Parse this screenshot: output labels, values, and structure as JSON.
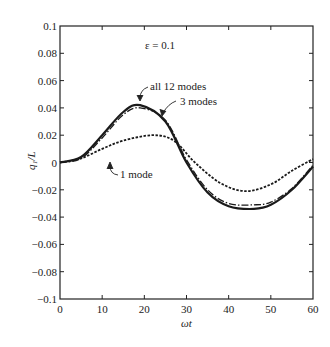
{
  "chart_data": {
    "type": "line",
    "title": "",
    "annotation": "ε = 0.1",
    "xlabel": "ωt",
    "ylabel": "q1/L",
    "xlim": [
      0,
      60
    ],
    "ylim": [
      -0.1,
      0.1
    ],
    "xticks": [
      0,
      10,
      20,
      30,
      40,
      50,
      60
    ],
    "xtick_labels": [
      "0",
      "10",
      "20",
      "30",
      "40",
      "50",
      "60"
    ],
    "yticks": [
      -0.1,
      -0.08,
      -0.06,
      -0.04,
      -0.02,
      0,
      0.02,
      0.04,
      0.06,
      0.08,
      0.1
    ],
    "ytick_labels": [
      "−0.1",
      "−0.08",
      "−0.06",
      "−0.04",
      "−0.02",
      "0",
      "0.02",
      "0.04",
      "0.06",
      "0.08",
      "0.1"
    ],
    "grid": false,
    "legend": "inline annotations with arrows",
    "x": [
      0,
      5,
      10,
      15,
      19,
      25,
      30,
      35,
      40,
      46,
      50,
      55,
      60
    ],
    "series": [
      {
        "name": "all 12 modes",
        "style": "solid",
        "values": [
          0,
          0.004,
          0.02,
          0.037,
          0.042,
          0.03,
          0.0,
          -0.022,
          -0.032,
          -0.034,
          -0.031,
          -0.02,
          -0.003
        ]
      },
      {
        "name": "3 modes",
        "style": "dash-dot",
        "values": [
          0,
          0.003,
          0.018,
          0.035,
          0.04,
          0.031,
          0.002,
          -0.02,
          -0.03,
          -0.031,
          -0.029,
          -0.019,
          -0.002
        ]
      },
      {
        "name": "1 mode",
        "style": "dashed",
        "x": [
          0,
          5,
          10,
          15,
          22,
          27,
          32,
          38,
          44,
          50,
          55,
          60
        ],
        "values": [
          0,
          0.003,
          0.01,
          0.016,
          0.02,
          0.016,
          0.0,
          -0.015,
          -0.021,
          -0.016,
          -0.006,
          0.0025
        ]
      }
    ]
  },
  "labels": {
    "annotation": "ε = 0.1",
    "xlabel": "ωt",
    "ylabel": "q₁/L",
    "all12": "all 12 modes",
    "three": "3 modes",
    "one": "1 mode"
  }
}
